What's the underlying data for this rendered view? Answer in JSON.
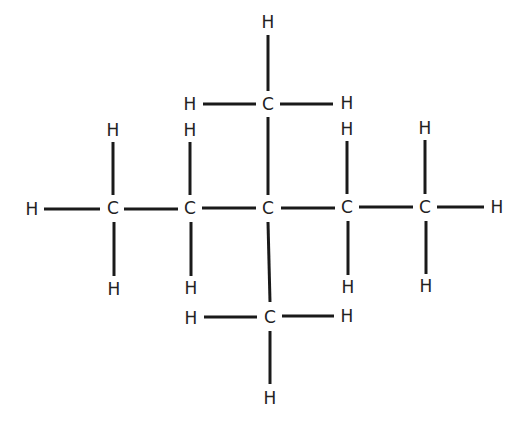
{
  "diagram": {
    "colors": {
      "bond": "#1a1a1a",
      "atom_text": "#222222",
      "background": "#ffffff"
    },
    "atoms": [
      {
        "id": "C1",
        "label": "C",
        "x": 113,
        "y": 208
      },
      {
        "id": "C2",
        "label": "C",
        "x": 190,
        "y": 208
      },
      {
        "id": "C3",
        "label": "C",
        "x": 268,
        "y": 208
      },
      {
        "id": "C4",
        "label": "C",
        "x": 347,
        "y": 207
      },
      {
        "id": "C5",
        "label": "C",
        "x": 425,
        "y": 207
      },
      {
        "id": "C6",
        "label": "C",
        "x": 268,
        "y": 104
      },
      {
        "id": "C7",
        "label": "C",
        "x": 270,
        "y": 317
      },
      {
        "id": "H1",
        "label": "H",
        "x": 32,
        "y": 209
      },
      {
        "id": "H2",
        "label": "H",
        "x": 113,
        "y": 130
      },
      {
        "id": "H3",
        "label": "H",
        "x": 114,
        "y": 289
      },
      {
        "id": "H4",
        "label": "H",
        "x": 190,
        "y": 130
      },
      {
        "id": "H5",
        "label": "H",
        "x": 191,
        "y": 288
      },
      {
        "id": "H6",
        "label": "H",
        "x": 347,
        "y": 129
      },
      {
        "id": "H7",
        "label": "H",
        "x": 348,
        "y": 287
      },
      {
        "id": "H8",
        "label": "H",
        "x": 425,
        "y": 128
      },
      {
        "id": "H9",
        "label": "H",
        "x": 426,
        "y": 286
      },
      {
        "id": "H10",
        "label": "H",
        "x": 497,
        "y": 207
      },
      {
        "id": "H11",
        "label": "H",
        "x": 190,
        "y": 104
      },
      {
        "id": "H12",
        "label": "H",
        "x": 347,
        "y": 103
      },
      {
        "id": "H13",
        "label": "H",
        "x": 268,
        "y": 22
      },
      {
        "id": "H14",
        "label": "H",
        "x": 191,
        "y": 318
      },
      {
        "id": "H15",
        "label": "H",
        "x": 347,
        "y": 316
      },
      {
        "id": "H16",
        "label": "H",
        "x": 270,
        "y": 398
      }
    ],
    "bonds": [
      {
        "from": "H1",
        "to": "C1",
        "x1": 44,
        "y1": 209,
        "x2": 100,
        "y2": 209
      },
      {
        "from": "C1",
        "to": "C2",
        "x1": 124,
        "y1": 209,
        "x2": 178,
        "y2": 209
      },
      {
        "from": "C2",
        "to": "C3",
        "x1": 202,
        "y1": 208,
        "x2": 256,
        "y2": 208
      },
      {
        "from": "C3",
        "to": "C4",
        "x1": 281,
        "y1": 208,
        "x2": 335,
        "y2": 208
      },
      {
        "from": "C4",
        "to": "C5",
        "x1": 359,
        "y1": 207,
        "x2": 413,
        "y2": 207
      },
      {
        "from": "C5",
        "to": "H10",
        "x1": 437,
        "y1": 207,
        "x2": 484,
        "y2": 207
      },
      {
        "from": "C1",
        "to": "H2",
        "x1": 113,
        "y1": 142,
        "x2": 113,
        "y2": 195
      },
      {
        "from": "C1",
        "to": "H3",
        "x1": 114,
        "y1": 222,
        "x2": 114,
        "y2": 276
      },
      {
        "from": "C2",
        "to": "H4",
        "x1": 190,
        "y1": 142,
        "x2": 190,
        "y2": 195
      },
      {
        "from": "C2",
        "to": "H5",
        "x1": 191,
        "y1": 222,
        "x2": 191,
        "y2": 276
      },
      {
        "from": "C4",
        "to": "H6",
        "x1": 347,
        "y1": 141,
        "x2": 347,
        "y2": 194
      },
      {
        "from": "C4",
        "to": "H7",
        "x1": 348,
        "y1": 221,
        "x2": 348,
        "y2": 275
      },
      {
        "from": "C5",
        "to": "H8",
        "x1": 425,
        "y1": 140,
        "x2": 425,
        "y2": 194
      },
      {
        "from": "C5",
        "to": "H9",
        "x1": 426,
        "y1": 221,
        "x2": 426,
        "y2": 274
      },
      {
        "from": "C3",
        "to": "C6",
        "x1": 268,
        "y1": 117,
        "x2": 268,
        "y2": 195
      },
      {
        "from": "C6",
        "to": "H13",
        "x1": 268,
        "y1": 35,
        "x2": 268,
        "y2": 91
      },
      {
        "from": "H11",
        "to": "C6",
        "x1": 203,
        "y1": 104,
        "x2": 256,
        "y2": 104
      },
      {
        "from": "C6",
        "to": "H12",
        "x1": 280,
        "y1": 104,
        "x2": 333,
        "y2": 104
      },
      {
        "from": "C3",
        "to": "C7",
        "x1": 268,
        "y1": 222,
        "x2": 270,
        "y2": 302
      },
      {
        "from": "C7",
        "to": "H16",
        "x1": 270,
        "y1": 331,
        "x2": 270,
        "y2": 384
      },
      {
        "from": "H14",
        "to": "C7",
        "x1": 204,
        "y1": 317,
        "x2": 257,
        "y2": 317
      },
      {
        "from": "C7",
        "to": "H15",
        "x1": 282,
        "y1": 316,
        "x2": 334,
        "y2": 316
      }
    ]
  }
}
